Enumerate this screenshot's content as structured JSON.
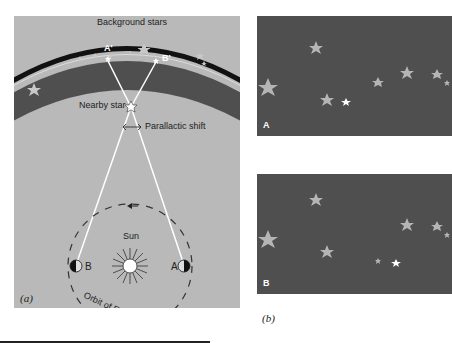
{
  "figure": {
    "panel_a": {
      "caption": "(a)",
      "labels": {
        "background_stars": "Background stars",
        "a_prime": "A'",
        "b_prime": "B'",
        "nearby_star": "Nearby star",
        "parallactic_shift": "Parallactic shift",
        "sun": "Sun",
        "earth_a": "A",
        "earth_b": "B",
        "orbit": "Orbit of Earth"
      },
      "colors": {
        "background": "#b9b9b9",
        "star_band": "#4f4f4f",
        "sight_lines": "#ffffff"
      }
    },
    "panel_b": {
      "caption": "(b)",
      "views": [
        {
          "label": "A"
        },
        {
          "label": "B"
        }
      ],
      "colors": {
        "sky": "#4f4f4f",
        "background_star": "#b5b5b5",
        "nearby_star": "#ffffff"
      }
    }
  }
}
